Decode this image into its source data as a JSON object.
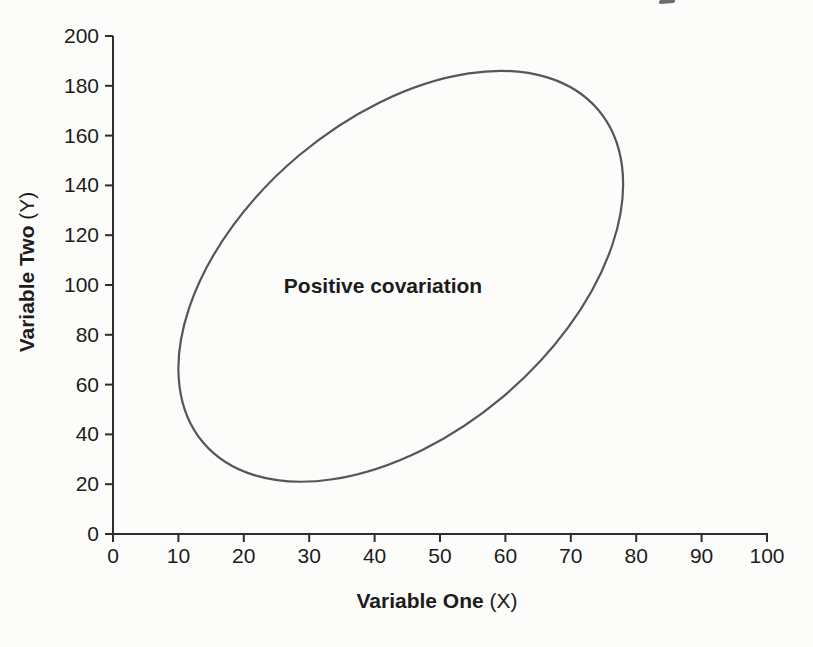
{
  "page": {
    "background": "#fcfcfa"
  },
  "chart_data": {
    "type": "scatter",
    "title": "",
    "xlabel": "Variable One",
    "xlabel_unit": "(X)",
    "ylabel": "Variable Two",
    "ylabel_unit": "(Y)",
    "xlim": [
      0,
      100
    ],
    "ylim": [
      0,
      200
    ],
    "xticks": [
      0,
      10,
      20,
      30,
      40,
      50,
      60,
      70,
      80,
      90,
      100
    ],
    "yticks": [
      0,
      20,
      40,
      60,
      80,
      100,
      120,
      140,
      160,
      180,
      200
    ],
    "grid": false,
    "legend": null,
    "annotation": {
      "text": "Positive covariation",
      "x": 41,
      "y": 100
    },
    "ellipse_region": {
      "x_min": 10,
      "x_max": 78,
      "y_min": 21,
      "y_max": 186,
      "tilt_deg": 40
    },
    "colors": {
      "axis": "#2d2d2d",
      "text": "#1c1c1c",
      "ellipse_stroke": "#53575a"
    }
  }
}
